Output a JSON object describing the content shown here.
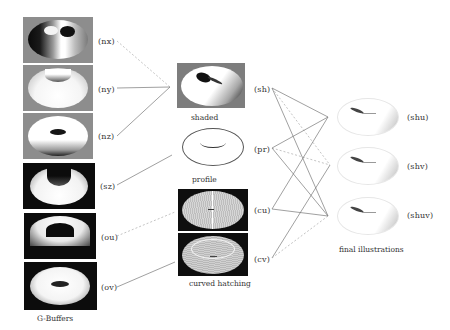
{
  "gbuffers": {
    "caption": "G-Buffers",
    "items": [
      {
        "label": "(nx)",
        "name": "nx"
      },
      {
        "label": "(ny)",
        "name": "ny"
      },
      {
        "label": "(nz)",
        "name": "nz"
      },
      {
        "label": "(sz)",
        "name": "sz"
      },
      {
        "label": "(ou)",
        "name": "ou"
      },
      {
        "label": "(ov)",
        "name": "ov"
      }
    ]
  },
  "intermediate": {
    "shaded_caption": "shaded",
    "profile_caption": "profile",
    "hatching_caption": "curved hatching",
    "labels": [
      "(sh)",
      "(pr)",
      "(cu)",
      "(cv)"
    ]
  },
  "final": {
    "caption": "final illustrations",
    "items": [
      {
        "label": "(shu)"
      },
      {
        "label": "(shv)"
      },
      {
        "label": "(shuv)"
      }
    ]
  },
  "colors": {
    "line": "#777777",
    "dashed_line": "#aaaaaa",
    "gray_bg": "#8a8a8a",
    "dark_bg": "#111111"
  }
}
